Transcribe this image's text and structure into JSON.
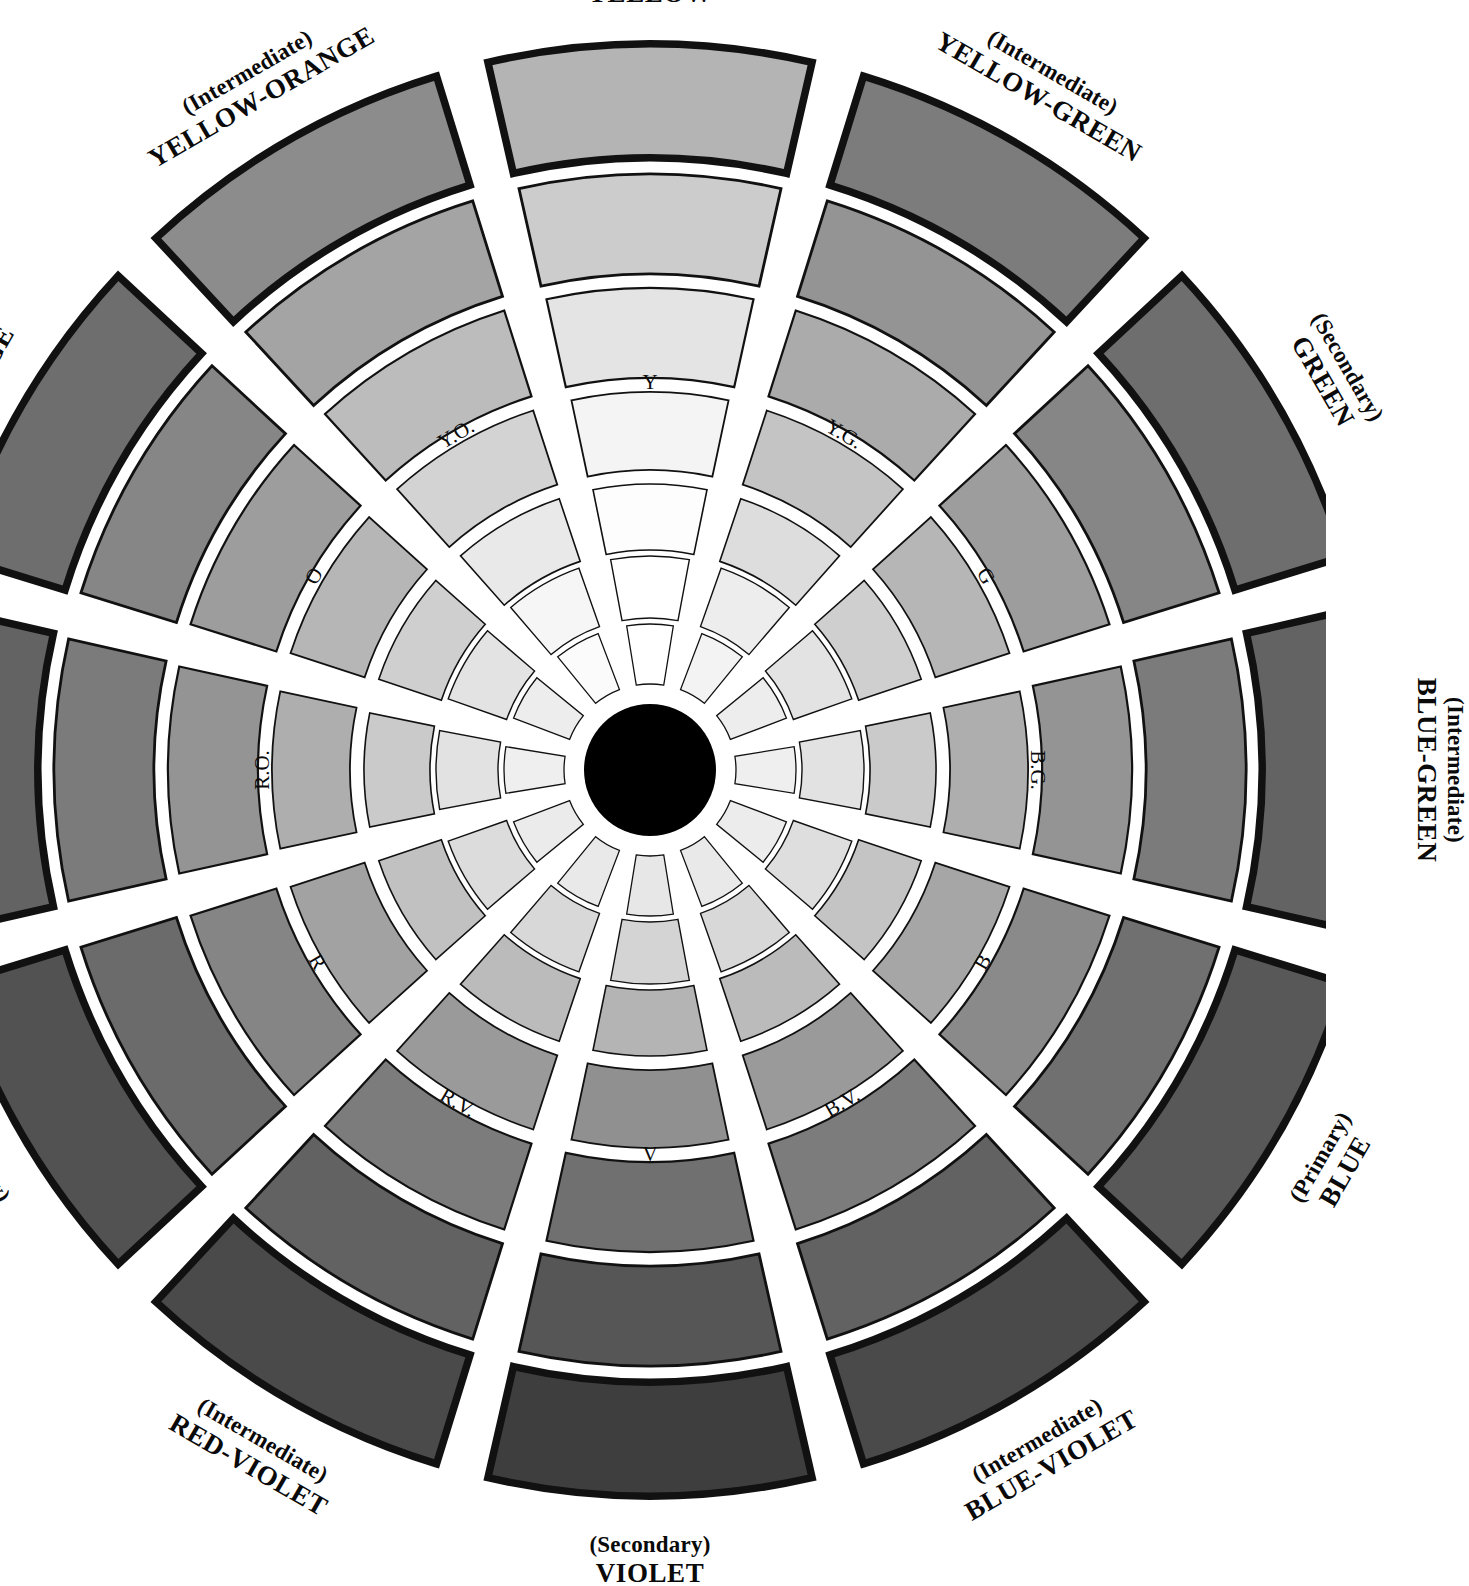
{
  "figure": {
    "type": "color-wheel-diagram",
    "title_text_visible": false,
    "background_color": "#ffffff",
    "hub_color": "#000000",
    "outline_color": "#111111"
  },
  "chart_data": {
    "type": "pie",
    "title": "",
    "xlabel": "",
    "ylabel": "",
    "legend_position": "around-perimeter",
    "grid": false,
    "ring_count": 7,
    "spoke_count": 12,
    "hub": "black center circle",
    "ring_order_outward": [
      "shade-3",
      "shade-2",
      "shade-1",
      "hue",
      "tint-1",
      "tint-2",
      "tint-3"
    ],
    "categories": [
      "YELLOW",
      "YELLOW-GREEN",
      "GREEN",
      "BLUE-GREEN",
      "BLUE",
      "BLUE-VIOLET",
      "VIOLET",
      "RED-VIOLET",
      "RED",
      "RED-ORANGE",
      "ORANGE",
      "YELLOW-ORANGE"
    ],
    "values": [
      30,
      30,
      30,
      30,
      30,
      30,
      30,
      30,
      30,
      30,
      30,
      30
    ],
    "series": [
      {
        "name": "base value (0=white .. 100=black)",
        "values": [
          8,
          24,
          34,
          42,
          48,
          58,
          66,
          58,
          50,
          42,
          34,
          20
        ]
      }
    ],
    "value_scale_note": "Each spoke's 7 bands step from near-white at the rim to near-black at the hub."
  },
  "spokes": [
    {
      "id": "yellow",
      "abbrev": "Y",
      "qualifier": "(Primary)",
      "name": "YELLOW",
      "angle_deg": 270,
      "swatches": [
        "#ffffff",
        "#ffffff",
        "#fdfdfd",
        "#f4f4f4",
        "#e4e4e4",
        "#cccccc",
        "#b4b4b4"
      ]
    },
    {
      "id": "yellow-green",
      "abbrev": "Y.G.",
      "qualifier": "(Intermediate)",
      "name": "YELLOW-GREEN",
      "angle_deg": 300,
      "swatches": [
        "#f3f3f3",
        "#ededed",
        "#dddddd",
        "#c4c4c4",
        "#ababab",
        "#949494",
        "#7c7c7c"
      ]
    },
    {
      "id": "green",
      "abbrev": "G",
      "qualifier": "(Secondary)",
      "name": "GREEN",
      "angle_deg": 330,
      "swatches": [
        "#ededed",
        "#e3e3e3",
        "#cfcfcf",
        "#b6b6b6",
        "#9d9d9d",
        "#868686",
        "#6e6e6e"
      ]
    },
    {
      "id": "blue-green",
      "abbrev": "B.G.",
      "qualifier": "(Intermediate)",
      "name": "BLUE-GREEN",
      "angle_deg": 0,
      "swatches": [
        "#efefef",
        "#e2e2e2",
        "#cacaca",
        "#aeaeae",
        "#949494",
        "#7b7b7b",
        "#636363"
      ]
    },
    {
      "id": "blue",
      "abbrev": "B",
      "qualifier": "(Primary)",
      "name": "BLUE",
      "angle_deg": 30,
      "swatches": [
        "#ececec",
        "#dedede",
        "#c4c4c4",
        "#a6a6a6",
        "#8a8a8a",
        "#707070",
        "#585858"
      ]
    },
    {
      "id": "blue-violet",
      "abbrev": "B.V.",
      "qualifier": "(Intermediate)",
      "name": "BLUE-VIOLET",
      "angle_deg": 60,
      "swatches": [
        "#e9e9e9",
        "#d8d8d8",
        "#bbbbbb",
        "#9a9a9a",
        "#7c7c7c",
        "#626262",
        "#4a4a4a"
      ]
    },
    {
      "id": "violet",
      "abbrev": "V",
      "qualifier": "(Secondary)",
      "name": "VIOLET",
      "angle_deg": 90,
      "swatches": [
        "#e7e7e7",
        "#d4d4d4",
        "#b4b4b4",
        "#909090",
        "#707070",
        "#565656",
        "#3e3e3e"
      ]
    },
    {
      "id": "red-violet",
      "abbrev": "R.V.",
      "qualifier": "(Intermediate)",
      "name": "RED-VIOLET",
      "angle_deg": 120,
      "swatches": [
        "#e9e9e9",
        "#d8d8d8",
        "#bbbbbb",
        "#9a9a9a",
        "#7c7c7c",
        "#626262",
        "#4a4a4a"
      ]
    },
    {
      "id": "red",
      "abbrev": "R",
      "qualifier": "(Primary)",
      "name": "RED",
      "angle_deg": 150,
      "swatches": [
        "#ebebeb",
        "#dcdcdc",
        "#c1c1c1",
        "#a2a2a2",
        "#858585",
        "#6b6b6b",
        "#525252"
      ]
    },
    {
      "id": "red-orange",
      "abbrev": "R.O.",
      "qualifier": "(Intermediate)",
      "name": "RED-ORANGE",
      "angle_deg": 180,
      "swatches": [
        "#efefef",
        "#e2e2e2",
        "#cacaca",
        "#aeaeae",
        "#949494",
        "#7b7b7b",
        "#636363"
      ]
    },
    {
      "id": "orange",
      "abbrev": "O",
      "qualifier": "(Secondary)",
      "name": "ORANGE",
      "angle_deg": 210,
      "swatches": [
        "#ededed",
        "#e3e3e3",
        "#cfcfcf",
        "#b6b6b6",
        "#9d9d9d",
        "#868686",
        "#6e6e6e"
      ]
    },
    {
      "id": "yellow-orange",
      "abbrev": "Y.O.",
      "qualifier": "(Intermediate)",
      "name": "YELLOW-ORANGE",
      "angle_deg": 240,
      "swatches": [
        "#fbfbfb",
        "#f6f6f6",
        "#e9e9e9",
        "#d3d3d3",
        "#bcbcbc",
        "#a4a4a4",
        "#8c8c8c"
      ]
    }
  ]
}
